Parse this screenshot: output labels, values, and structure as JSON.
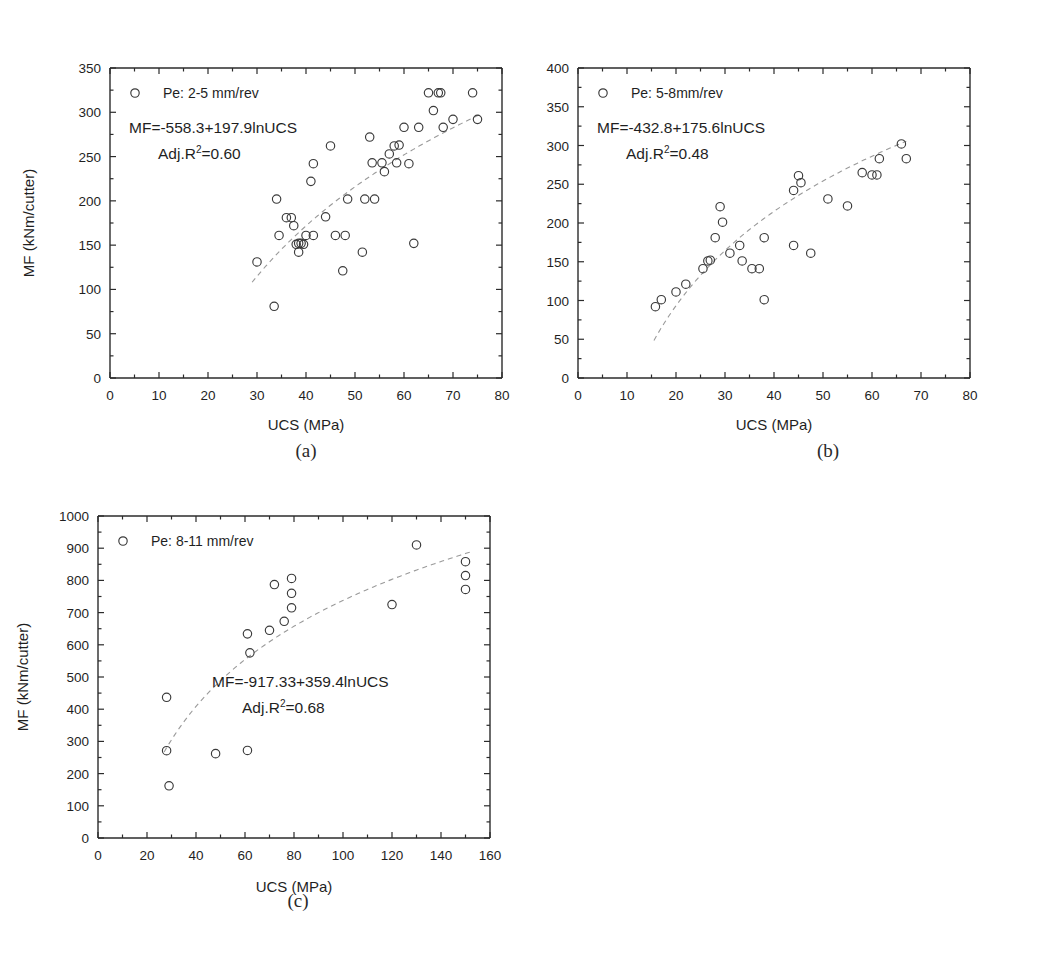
{
  "figure": {
    "panels": [
      {
        "id": "a",
        "caption": "(a)",
        "legend_label": "Pe: 2-5 mm/rev",
        "equation_line1": "MF=-558.3+197.9lnUCS",
        "equation_line2_prefix": "Adj.R",
        "equation_line2_sup": "2",
        "equation_line2_suffix": "=0.60",
        "xlabel": "UCS (MPa)",
        "ylabel": "MF (kNm/cutter)",
        "xticks": [
          "0",
          "10",
          "20",
          "30",
          "40",
          "50",
          "60",
          "70",
          "80"
        ],
        "yticks": [
          "0",
          "50",
          "100",
          "150",
          "200",
          "250",
          "300",
          "350"
        ]
      },
      {
        "id": "b",
        "caption": "(b)",
        "legend_label": "Pe: 5-8mm/rev",
        "equation_line1": "MF=-432.8+175.6lnUCS",
        "equation_line2_prefix": "Adj.R",
        "equation_line2_sup": "2",
        "equation_line2_suffix": "=0.48",
        "xlabel": "UCS (MPa)",
        "ylabel": "MF (kNm/cutter)",
        "xticks": [
          "0",
          "10",
          "20",
          "30",
          "40",
          "50",
          "60",
          "70",
          "80"
        ],
        "yticks": [
          "0",
          "50",
          "100",
          "150",
          "200",
          "250",
          "300",
          "350",
          "400"
        ]
      },
      {
        "id": "c",
        "caption": "(c)",
        "legend_label": "Pe: 8-11 mm/rev",
        "equation_line1": "MF=-917.33+359.4lnUCS",
        "equation_line2_prefix": "Adj.R",
        "equation_line2_sup": "2",
        "equation_line2_suffix": "=0.68",
        "xlabel": "UCS (MPa)",
        "ylabel": "MF (kNm/cutter)",
        "xticks": [
          "0",
          "20",
          "40",
          "60",
          "80",
          "100",
          "120",
          "140",
          "160"
        ],
        "yticks": [
          "0",
          "100",
          "200",
          "300",
          "400",
          "500",
          "600",
          "700",
          "800",
          "900",
          "1000"
        ]
      }
    ]
  },
  "chart_data": [
    {
      "type": "scatter",
      "panel": "a",
      "title": "",
      "xlabel": "UCS (MPa)",
      "ylabel": "MF (kNm/cutter)",
      "xlim": [
        0,
        80
      ],
      "ylim": [
        0,
        350
      ],
      "xticks": [
        0,
        10,
        20,
        30,
        40,
        50,
        60,
        70,
        80
      ],
      "yticks": [
        0,
        50,
        100,
        150,
        200,
        250,
        300,
        350
      ],
      "grid": false,
      "legend": [
        "Pe: 2-5 mm/rev"
      ],
      "legend_position": "top-left",
      "marker": "open-circle",
      "annotations": [
        "MF=-558.3+197.9lnUCS",
        "Adj.R2=0.60"
      ],
      "fit": {
        "type": "log",
        "intercept": -558.3,
        "slope": 197.9,
        "adj_r2": 0.6,
        "xrange": [
          29,
          76
        ]
      },
      "points": [
        [
          30,
          131
        ],
        [
          33.5,
          81
        ],
        [
          34,
          202
        ],
        [
          34.5,
          161
        ],
        [
          36,
          181
        ],
        [
          37,
          181
        ],
        [
          37.5,
          172
        ],
        [
          38,
          151
        ],
        [
          38.5,
          152
        ],
        [
          38.5,
          142
        ],
        [
          39,
          152
        ],
        [
          39.5,
          151
        ],
        [
          40,
          161
        ],
        [
          41.5,
          161
        ],
        [
          41,
          222
        ],
        [
          41.5,
          242
        ],
        [
          44,
          182
        ],
        [
          45,
          262
        ],
        [
          46,
          161
        ],
        [
          47.5,
          121
        ],
        [
          48,
          161
        ],
        [
          48.5,
          202
        ],
        [
          51.5,
          142
        ],
        [
          52,
          202
        ],
        [
          53,
          272
        ],
        [
          53.5,
          243
        ],
        [
          54,
          202
        ],
        [
          55.5,
          243
        ],
        [
          56,
          233
        ],
        [
          57,
          253
        ],
        [
          58,
          262
        ],
        [
          58.5,
          243
        ],
        [
          59,
          263
        ],
        [
          60,
          283
        ],
        [
          61,
          242
        ],
        [
          62,
          152
        ],
        [
          63,
          283
        ],
        [
          65,
          322
        ],
        [
          66,
          302
        ],
        [
          67,
          322
        ],
        [
          67.5,
          322
        ],
        [
          68,
          283
        ],
        [
          70,
          292
        ],
        [
          74,
          322
        ],
        [
          75,
          292
        ]
      ]
    },
    {
      "type": "scatter",
      "panel": "b",
      "title": "",
      "xlabel": "UCS (MPa)",
      "ylabel": "MF (kNm/cutter)",
      "xlim": [
        0,
        80
      ],
      "ylim": [
        0,
        400
      ],
      "xticks": [
        0,
        10,
        20,
        30,
        40,
        50,
        60,
        70,
        80
      ],
      "yticks": [
        0,
        50,
        100,
        150,
        200,
        250,
        300,
        350,
        400
      ],
      "grid": false,
      "legend": [
        "Pe: 5-8mm/rev"
      ],
      "legend_position": "top-left",
      "marker": "open-circle",
      "annotations": [
        "MF=-432.8+175.6lnUCS",
        "Adj.R2=0.48"
      ],
      "fit": {
        "type": "log",
        "intercept": -432.8,
        "slope": 175.6,
        "adj_r2": 0.48,
        "xrange": [
          15.5,
          67
        ]
      },
      "points": [
        [
          15.8,
          92
        ],
        [
          17,
          101
        ],
        [
          20,
          111
        ],
        [
          22,
          121
        ],
        [
          25.5,
          141
        ],
        [
          26.5,
          151
        ],
        [
          27,
          152
        ],
        [
          28,
          181
        ],
        [
          29,
          221
        ],
        [
          29.5,
          201
        ],
        [
          31,
          161
        ],
        [
          33,
          171
        ],
        [
          33.5,
          151
        ],
        [
          35.5,
          141
        ],
        [
          37,
          141
        ],
        [
          38,
          181
        ],
        [
          38,
          101
        ],
        [
          44,
          171
        ],
        [
          44,
          242
        ],
        [
          45,
          261
        ],
        [
          45.5,
          252
        ],
        [
          47.5,
          161
        ],
        [
          51,
          231
        ],
        [
          55,
          222
        ],
        [
          58,
          265
        ],
        [
          60,
          262
        ],
        [
          61,
          262
        ],
        [
          61.5,
          283
        ],
        [
          66,
          302
        ],
        [
          67,
          283
        ]
      ]
    },
    {
      "type": "scatter",
      "panel": "c",
      "title": "",
      "xlabel": "UCS (MPa)",
      "ylabel": "MF (kNm/cutter)",
      "xlim": [
        0,
        160
      ],
      "ylim": [
        0,
        1000
      ],
      "xticks": [
        0,
        20,
        40,
        60,
        80,
        100,
        120,
        140,
        160
      ],
      "yticks": [
        0,
        100,
        200,
        300,
        400,
        500,
        600,
        700,
        800,
        900,
        1000
      ],
      "grid": false,
      "legend": [
        "Pe: 8-11 mm/rev"
      ],
      "legend_position": "top-left",
      "marker": "open-circle",
      "annotations": [
        "MF=-917.33+359.4lnUCS",
        "Adj.R2=0.68"
      ],
      "fit": {
        "type": "log",
        "intercept": -917.33,
        "slope": 359.4,
        "adj_r2": 0.68,
        "xrange": [
          27,
          152
        ]
      },
      "points": [
        [
          28,
          437
        ],
        [
          28,
          271
        ],
        [
          29,
          162
        ],
        [
          48,
          262
        ],
        [
          61,
          272
        ],
        [
          61,
          634
        ],
        [
          62,
          575
        ],
        [
          70,
          645
        ],
        [
          72,
          787
        ],
        [
          76,
          673
        ],
        [
          79,
          806
        ],
        [
          79,
          760
        ],
        [
          79,
          715
        ],
        [
          120,
          725
        ],
        [
          130,
          910
        ],
        [
          150,
          858
        ],
        [
          150,
          815
        ],
        [
          150,
          772
        ]
      ]
    }
  ]
}
